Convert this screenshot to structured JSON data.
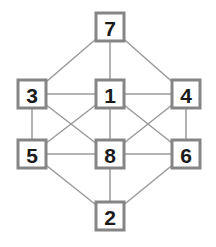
{
  "diagram": {
    "type": "graph",
    "colors": {
      "edge": "#9a9a9a",
      "node_border": "#858585",
      "node_fill": "#ffffff",
      "label": "#1a1a1a"
    },
    "nodes": [
      {
        "id": "7",
        "label": "7",
        "x": 110,
        "y": 27
      },
      {
        "id": "3",
        "label": "3",
        "x": 32,
        "y": 94
      },
      {
        "id": "1",
        "label": "1",
        "x": 110,
        "y": 94
      },
      {
        "id": "4",
        "label": "4",
        "x": 186,
        "y": 94
      },
      {
        "id": "5",
        "label": "5",
        "x": 32,
        "y": 154
      },
      {
        "id": "8",
        "label": "8",
        "x": 110,
        "y": 154
      },
      {
        "id": "6",
        "label": "6",
        "x": 186,
        "y": 154
      },
      {
        "id": "2",
        "label": "2",
        "x": 110,
        "y": 216
      }
    ],
    "edges": [
      [
        "7",
        "3"
      ],
      [
        "7",
        "1"
      ],
      [
        "7",
        "4"
      ],
      [
        "3",
        "1"
      ],
      [
        "1",
        "4"
      ],
      [
        "3",
        "5"
      ],
      [
        "3",
        "8"
      ],
      [
        "1",
        "5"
      ],
      [
        "1",
        "8"
      ],
      [
        "1",
        "6"
      ],
      [
        "4",
        "8"
      ],
      [
        "4",
        "6"
      ],
      [
        "5",
        "8"
      ],
      [
        "8",
        "6"
      ],
      [
        "5",
        "2"
      ],
      [
        "8",
        "2"
      ],
      [
        "6",
        "2"
      ]
    ]
  }
}
